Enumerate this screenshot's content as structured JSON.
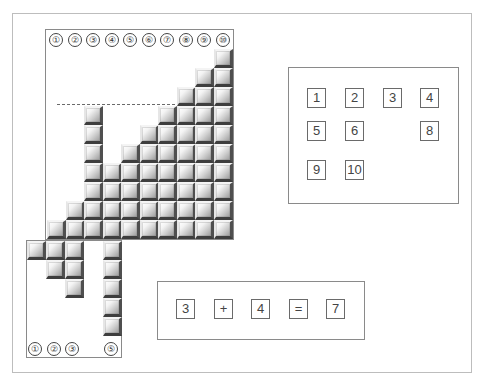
{
  "diagram": {
    "top_labels": [
      "①",
      "②",
      "③",
      "④",
      "⑤",
      "⑥",
      "⑦",
      "⑧",
      "⑨",
      "⑩"
    ],
    "bottom_labels": [
      {
        "label": "①",
        "x": 28
      },
      {
        "label": "②",
        "x": 47
      },
      {
        "label": "③",
        "x": 65
      },
      {
        "label": "⑤",
        "x": 104
      }
    ],
    "column_heights": [
      1,
      2,
      7,
      4,
      5,
      6,
      7,
      8,
      9,
      10
    ],
    "fallen_blocks_description": "Blocks below baseline: row1 at cols shifted (x 27,46,65,103), row2 (46,65,103), row3 (65,103), col5 stack of 5",
    "dashed_line_level": 7,
    "block_color_light": "#ffffff",
    "block_color_dark": "#3e3e3e"
  },
  "number_panel": {
    "items": [
      {
        "label": "1",
        "row": 0,
        "col": 0
      },
      {
        "label": "2",
        "row": 0,
        "col": 1
      },
      {
        "label": "3",
        "row": 0,
        "col": 2
      },
      {
        "label": "4",
        "row": 0,
        "col": 3
      },
      {
        "label": "5",
        "row": 1,
        "col": 0
      },
      {
        "label": "6",
        "row": 1,
        "col": 1
      },
      {
        "label": "8",
        "row": 1,
        "col": 3
      },
      {
        "label": "9",
        "row": 2,
        "col": 0
      },
      {
        "label": "10",
        "row": 2,
        "col": 1
      }
    ]
  },
  "equation": {
    "tokens": [
      "3",
      "+",
      "4",
      "=",
      "7"
    ]
  }
}
